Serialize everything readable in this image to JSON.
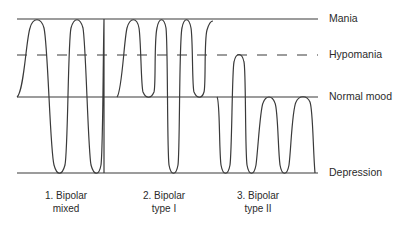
{
  "diagram": {
    "levels": {
      "mania": "Mania",
      "hypomania": "Hypomania",
      "normal": "Normal mood",
      "depression": "Depression"
    },
    "types": [
      {
        "line1": "1. Bipolar",
        "line2": "mixed"
      },
      {
        "line1": "2. Bipolar",
        "line2": "type I"
      },
      {
        "line1": "3. Bipolar",
        "line2": "type II"
      }
    ],
    "colors": {
      "line": "#3a3a3a",
      "background": "#ffffff"
    }
  }
}
